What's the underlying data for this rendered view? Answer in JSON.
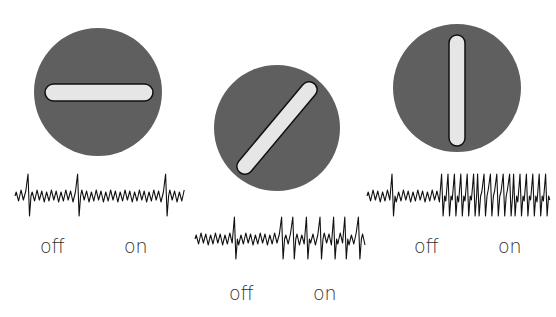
{
  "colors": {
    "disc": "#5f5f5f",
    "bar_fill": "#e6e6e6",
    "bar_stroke": "#111111",
    "trace": "#111111",
    "label": "#333333"
  },
  "panels": [
    {
      "stimulus_orientation": "horizontal",
      "response": "weak",
      "off_label": "off",
      "on_label": "on"
    },
    {
      "stimulus_orientation": "diagonal",
      "response": "moderate",
      "off_label": "off",
      "on_label": "on"
    },
    {
      "stimulus_orientation": "vertical",
      "response": "strong",
      "off_label": "off",
      "on_label": "on"
    }
  ]
}
